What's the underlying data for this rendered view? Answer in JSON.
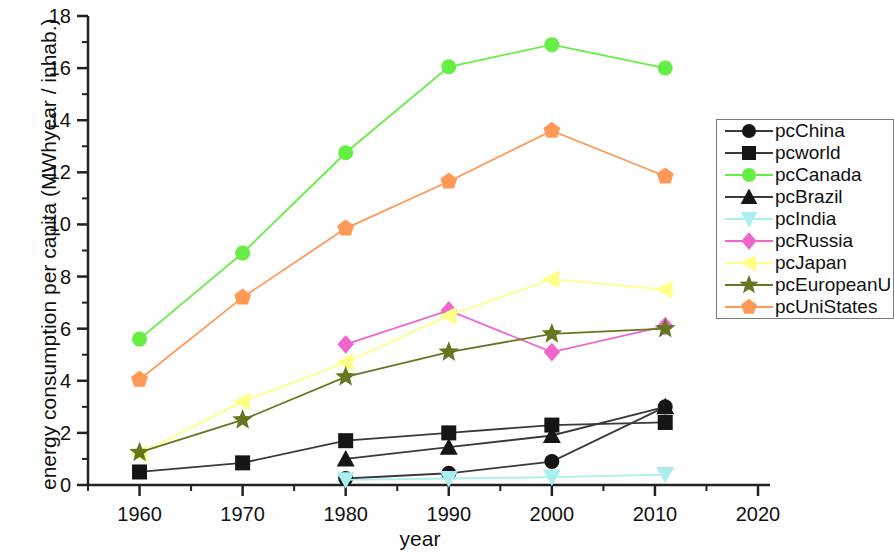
{
  "chart_data": {
    "type": "line",
    "title": "",
    "xlabel": "year",
    "ylabel": "energy consumption per capita (MWhyear / inhab.)",
    "xlim": [
      1955,
      2020
    ],
    "ylim": [
      0,
      18
    ],
    "xticks": [
      1960,
      1970,
      1980,
      1990,
      2000,
      2010,
      2020
    ],
    "yticks": [
      0,
      2,
      4,
      6,
      8,
      10,
      12,
      14,
      16,
      18
    ],
    "xtick_labels": [
      "1960",
      "1970",
      "1980",
      "1990",
      "2000",
      "2010",
      "2020"
    ],
    "ytick_labels": [
      "0",
      "2",
      "4",
      "6",
      "8",
      "10",
      "12",
      "14",
      "16",
      "18"
    ],
    "minor_ticks": true,
    "grid": false,
    "legend_position": "right",
    "series": [
      {
        "name": "pcChina",
        "color": "#151515",
        "marker": "circle",
        "x": [
          1980,
          1990,
          2000,
          2011
        ],
        "values": [
          0.25,
          0.45,
          0.9,
          3.0
        ]
      },
      {
        "name": "pcworld",
        "color": "#151515",
        "marker": "square",
        "x": [
          1960,
          1970,
          1980,
          1990,
          2000,
          2011
        ],
        "values": [
          0.5,
          0.85,
          1.7,
          2.0,
          2.3,
          2.4
        ]
      },
      {
        "name": "pcCanada",
        "color": "#66ee44",
        "marker": "circle",
        "x": [
          1960,
          1970,
          1980,
          1990,
          2000,
          2011
        ],
        "values": [
          5.6,
          8.9,
          12.75,
          16.05,
          16.9,
          16.0
        ]
      },
      {
        "name": "pcBrazil",
        "color": "#151515",
        "marker": "triangle-up",
        "x": [
          1980,
          1990,
          2000,
          2011
        ],
        "values": [
          1.0,
          1.45,
          1.9,
          3.0
        ]
      },
      {
        "name": "pcIndia",
        "color": "#aaeeee",
        "marker": "triangle-down",
        "x": [
          1980,
          1990,
          2000,
          2011
        ],
        "values": [
          0.2,
          0.25,
          0.3,
          0.4
        ]
      },
      {
        "name": "pcRussia",
        "color": "#ee66cc",
        "marker": "diamond",
        "x": [
          1980,
          1990,
          2000,
          2011
        ],
        "values": [
          5.4,
          6.7,
          5.1,
          6.1
        ]
      },
      {
        "name": "pcJapan",
        "color": "#ffff88",
        "marker": "triangle-left",
        "x": [
          1960,
          1970,
          1980,
          1990,
          2000,
          2011
        ],
        "values": [
          1.2,
          3.2,
          4.7,
          6.5,
          7.9,
          7.5
        ]
      },
      {
        "name": "pcEuropeanU",
        "color": "#667722",
        "marker": "star",
        "x": [
          1960,
          1970,
          1980,
          1990,
          2000,
          2011
        ],
        "values": [
          1.25,
          2.5,
          4.15,
          5.1,
          5.8,
          6.0
        ]
      },
      {
        "name": "pcUniStates",
        "color": "#ff9955",
        "marker": "pentagon",
        "x": [
          1960,
          1970,
          1980,
          1990,
          2000,
          2011
        ],
        "values": [
          4.05,
          7.2,
          9.85,
          11.65,
          13.6,
          11.85
        ]
      }
    ]
  },
  "legend": {
    "entries": [
      {
        "label": "pcChina"
      },
      {
        "label": "pcworld"
      },
      {
        "label": "pcCanada"
      },
      {
        "label": "pcBrazil"
      },
      {
        "label": "pcIndia"
      },
      {
        "label": "pcRussia"
      },
      {
        "label": "pcJapan"
      },
      {
        "label": "pcEuropeanU"
      },
      {
        "label": "pcUniStates"
      }
    ]
  }
}
